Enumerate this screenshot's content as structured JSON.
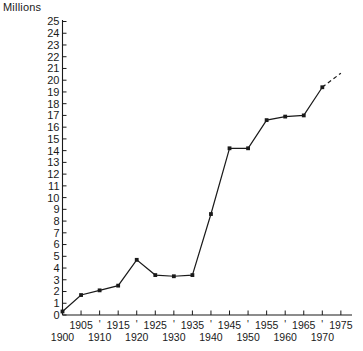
{
  "chart_data": {
    "type": "line",
    "title": "",
    "ylabel": "Millions",
    "xlabel": "",
    "ylim": [
      0,
      25
    ],
    "ytick_step": 1,
    "yticks": [
      0,
      1,
      2,
      3,
      4,
      5,
      6,
      7,
      8,
      9,
      10,
      11,
      12,
      13,
      14,
      15,
      16,
      17,
      18,
      19,
      20,
      21,
      22,
      23,
      24,
      25
    ],
    "xlim": [
      1900,
      1978
    ],
    "xticks_lower_row": [
      "1900",
      "1910",
      "1920",
      "1930",
      "1940",
      "1950",
      "1960",
      "1970"
    ],
    "xticks_upper_row": [
      "1905",
      "1915",
      "1925",
      "1935",
      "1945",
      "1955",
      "1965",
      "1975"
    ],
    "x": [
      1900,
      1905,
      1910,
      1915,
      1920,
      1925,
      1930,
      1935,
      1940,
      1945,
      1950,
      1955,
      1960,
      1965,
      1970
    ],
    "values": [
      0.3,
      1.7,
      2.1,
      2.5,
      4.7,
      3.4,
      3.3,
      3.4,
      8.6,
      14.2,
      14.2,
      16.6,
      16.9,
      17.0,
      19.4
    ],
    "series": [
      {
        "name": "Millions",
        "values": [
          0.3,
          1.7,
          2.1,
          2.5,
          4.7,
          3.4,
          3.3,
          3.4,
          8.6,
          14.2,
          14.2,
          16.6,
          16.9,
          17.0,
          19.4
        ]
      }
    ],
    "projection": {
      "style": "dashed",
      "from": [
        1970,
        19.4
      ],
      "to": [
        1975,
        20.6
      ]
    },
    "grid": false,
    "legend": false,
    "markers": "filled-square",
    "line_color": "#1a1a1a",
    "background_color": "#ffffff"
  },
  "axis": {
    "y_title": "Millions"
  },
  "separators": {
    "glyph": "'"
  }
}
